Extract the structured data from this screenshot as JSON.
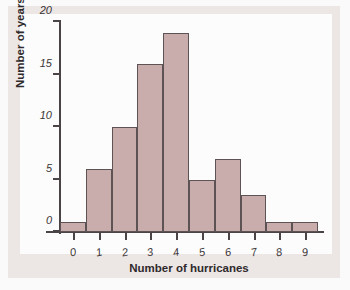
{
  "chart_data": {
    "type": "bar",
    "title": "",
    "xlabel": "Number of hurricanes",
    "ylabel": "Number of years",
    "categories": [
      "0",
      "1",
      "2",
      "3",
      "4",
      "5",
      "6",
      "7",
      "8",
      "9"
    ],
    "values": [
      1,
      6,
      10,
      16,
      19,
      5,
      7,
      3.5,
      1,
      1
    ],
    "xlim": [
      -0.5,
      9.5
    ],
    "ylim": [
      0,
      20
    ],
    "yticks": [
      0,
      5,
      10,
      15,
      20
    ],
    "ytick_labels": [
      "0",
      "5",
      "10",
      "15",
      "20"
    ],
    "xtick_labels": [
      "0",
      "1",
      "2",
      "3",
      "4",
      "5",
      "6",
      "7",
      "8",
      "9"
    ],
    "grid": false,
    "legend": false,
    "bar_color": "#c9acac",
    "bar_edge_color": "#5d5254",
    "axis_color": "#4a4446",
    "plot_background": "#fdfcfc",
    "panel_background": "#ece6e4"
  }
}
